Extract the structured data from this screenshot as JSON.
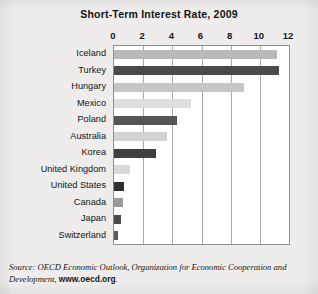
{
  "chart_data": {
    "type": "bar",
    "orientation": "horizontal",
    "title": "Short-Term Interest Rate, 2009",
    "xlabel": "",
    "ylabel": "",
    "xlim": [
      0,
      12
    ],
    "xticks": [
      0,
      2,
      4,
      6,
      8,
      10,
      12
    ],
    "xtick_labels": [
      "0",
      "2",
      "4",
      "6",
      "8",
      "10",
      "12"
    ],
    "grid": true,
    "legend": "none",
    "categories": [
      "Iceland",
      "Turkey",
      "Hungary",
      "Mexico",
      "Poland",
      "Australia",
      "Korea",
      "United Kingdom",
      "United States",
      "Canada",
      "Japan",
      "Switzerland"
    ],
    "values": [
      11.2,
      11.3,
      8.9,
      5.3,
      4.3,
      3.6,
      2.9,
      1.1,
      0.7,
      0.6,
      0.45,
      0.3
    ],
    "bar_colors": [
      "#b9b9b9",
      "#4a4a4a",
      "#c6c6c6",
      "#dedede",
      "#555555",
      "#d2d2d2",
      "#3f3f3f",
      "#d8d8d8",
      "#2e2e2e",
      "#9a9a9a",
      "#4a4a4a",
      "#5a5a5a"
    ]
  },
  "source": {
    "prefix": "Source: OECD Economic Outlook,",
    "body": " Organization for Economic Cooperation and Development,",
    "url": "www.oecd.org",
    "suffix": "."
  },
  "colors": {
    "page_background": "#eeedeb",
    "plot_background": "#ffffff",
    "gridline": "#a9a9a9",
    "frame": "#8f8f8f",
    "text": "#141414"
  }
}
